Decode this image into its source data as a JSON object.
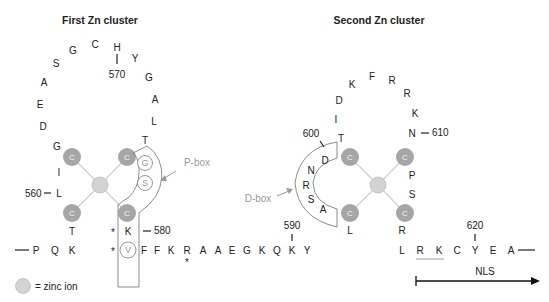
{
  "titles": {
    "first": "First Zn cluster",
    "second": "Second Zn cluster"
  },
  "colors": {
    "cysteine": "#a6a6a6",
    "zinc": "#d3d3d3",
    "box_outline": "#8c8c8c",
    "label_grey": "#9a9a9a",
    "text": "#222222"
  },
  "cluster1": {
    "loop": [
      "G",
      "D",
      "E",
      "A",
      "S",
      "G",
      "C",
      "H",
      "Y",
      "G",
      "A",
      "L",
      "T"
    ],
    "left_side": [
      "I",
      "L"
    ],
    "left_bottom": "T",
    "right_bottom": "K",
    "cys": [
      "C",
      "C",
      "C",
      "C"
    ],
    "pbox_residues": [
      "G",
      "S"
    ],
    "pbox_label": "P-box",
    "num_560": "560",
    "num_570": "570",
    "num_580": "580"
  },
  "cluster2": {
    "loop": [
      "T",
      "I",
      "D",
      "K",
      "F",
      "R",
      "R",
      "K",
      "N"
    ],
    "right_side": [
      "P",
      "S"
    ],
    "left_bottom": "L",
    "right_bottom": "R",
    "cys": [
      "C",
      "C",
      "C",
      "C"
    ],
    "dbox_residues": [
      "D",
      "N",
      "R",
      "S",
      "A"
    ],
    "dbox_label": "D-box",
    "num_600": "600",
    "num_610": "610"
  },
  "sequence": {
    "start": [
      "P",
      "Q",
      "K"
    ],
    "v_residue": "V",
    "middle": [
      "F",
      "F",
      "K",
      "R",
      "A",
      "A",
      "E",
      "G",
      "K",
      "Q",
      "K",
      "Y"
    ],
    "end": [
      "L",
      "R",
      "K",
      "C",
      "Y",
      "E",
      "A"
    ],
    "star": "*",
    "num_590": "590",
    "num_620": "620"
  },
  "nls": {
    "label": "NLS"
  },
  "legend": {
    "label": "= zinc ion"
  }
}
